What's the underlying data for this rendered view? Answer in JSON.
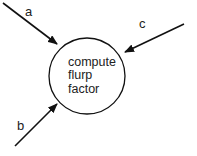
{
  "diagram": {
    "type": "data-flow process bubble",
    "process": {
      "lines": [
        "compute",
        "flurp",
        "factor"
      ],
      "shape": "circle"
    },
    "inputs": [
      {
        "label": "a",
        "direction": "from top-left into process"
      },
      {
        "label": "b",
        "direction": "from bottom-left into process"
      },
      {
        "label": "c",
        "direction": "from top-right into process"
      }
    ],
    "colors": {
      "stroke": "#111111",
      "text": "#222222",
      "background": "#ffffff"
    }
  }
}
